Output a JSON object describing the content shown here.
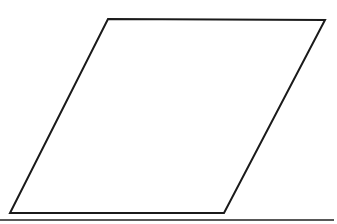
{
  "canvas": {
    "width": 337,
    "height": 224,
    "background_color": "#ffffff"
  },
  "figure": {
    "name": "parallelogram",
    "shape_type": "parallelogram",
    "fill_color": "#ffffff",
    "stroke_color": "#1a1a1a",
    "stroke_width": 2,
    "vertices": [
      {
        "label": "top-left",
        "x": 108,
        "y": 19
      },
      {
        "label": "top-right",
        "x": 325,
        "y": 20
      },
      {
        "label": "bottom-right",
        "x": 224,
        "y": 213
      },
      {
        "label": "bottom-left",
        "x": 10,
        "y": 213
      }
    ],
    "points_attr": "108,19 325,20 224,213 10,213",
    "edges": [
      {
        "name": "top-edge",
        "from": "top-left",
        "to": "top-right"
      },
      {
        "name": "right-edge",
        "from": "top-right",
        "to": "bottom-right"
      },
      {
        "name": "bottom-edge",
        "from": "bottom-right",
        "to": "bottom-left"
      },
      {
        "name": "left-edge",
        "from": "bottom-left",
        "to": "top-left"
      }
    ]
  },
  "scan_artifact": {
    "name": "bottom-border-line",
    "color": "#3b3b3b",
    "x": 0,
    "y": 219,
    "width": 334,
    "height": 2
  }
}
